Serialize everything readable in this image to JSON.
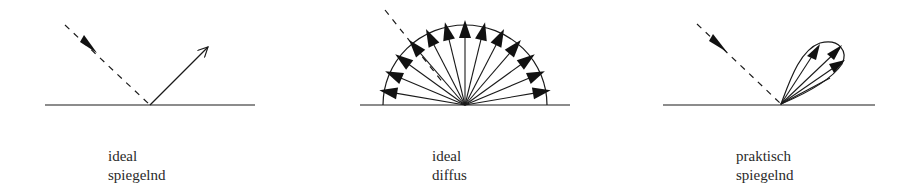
{
  "panels": [
    {
      "id": "ideal-specular",
      "label_line1": "ideal",
      "label_line2": "spiegelnd"
    },
    {
      "id": "ideal-diffuse",
      "label_line1": "ideal",
      "label_line2": "diffus"
    },
    {
      "id": "practical-specular",
      "label_line1": "praktisch",
      "label_line2": "spiegelnd"
    }
  ],
  "colors": {
    "stroke": "#1a1a1a",
    "background": "#ffffff"
  }
}
